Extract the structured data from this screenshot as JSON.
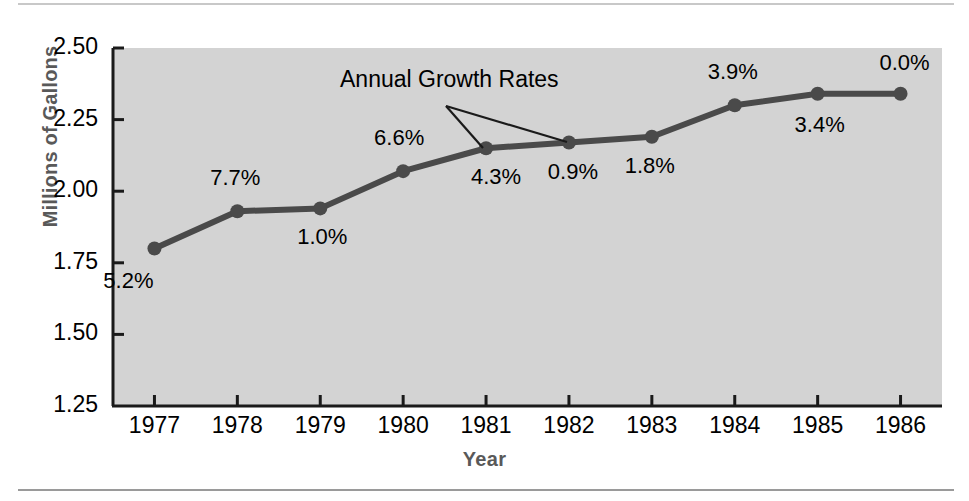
{
  "figure": {
    "background_color": "#ffffff",
    "plot_background_color": "#d3d3d3",
    "line_color": "#4a4a4a",
    "axis_color": "#1a1a1a",
    "axis_title_color": "#595959"
  },
  "annotation": {
    "label": "Annual Growth Rates",
    "points_to": [
      "1981",
      "1982"
    ]
  },
  "chart_data": {
    "type": "line",
    "title": "",
    "xlabel": "Year",
    "ylabel": "Millions of Gallons",
    "categories": [
      "1977",
      "1978",
      "1979",
      "1980",
      "1981",
      "1982",
      "1983",
      "1984",
      "1985",
      "1986"
    ],
    "values": [
      1.8,
      1.93,
      1.94,
      2.07,
      2.15,
      2.17,
      2.19,
      2.3,
      2.34,
      2.34
    ],
    "point_labels": [
      "5.2%",
      "7.7%",
      "1.0%",
      "6.6%",
      "4.3%",
      "0.9%",
      "1.8%",
      "3.9%",
      "3.4%",
      "0.0%"
    ],
    "ylim": [
      1.25,
      2.5
    ],
    "yticks": [
      "1.25",
      "1.50",
      "1.75",
      "2.00",
      "2.25",
      "2.50"
    ],
    "ytick_values": [
      1.25,
      1.5,
      1.75,
      2.0,
      2.25,
      2.5
    ],
    "xtick_labels": [
      "1977",
      "1978",
      "1979",
      "1980",
      "1981",
      "1982",
      "1983",
      "1984",
      "1985",
      "1986"
    ],
    "grid": false,
    "legend": "none",
    "series": [
      {
        "name": "Millions of Gallons",
        "values": [
          1.8,
          1.93,
          1.94,
          2.07,
          2.15,
          2.17,
          2.19,
          2.3,
          2.34,
          2.34
        ]
      }
    ]
  }
}
